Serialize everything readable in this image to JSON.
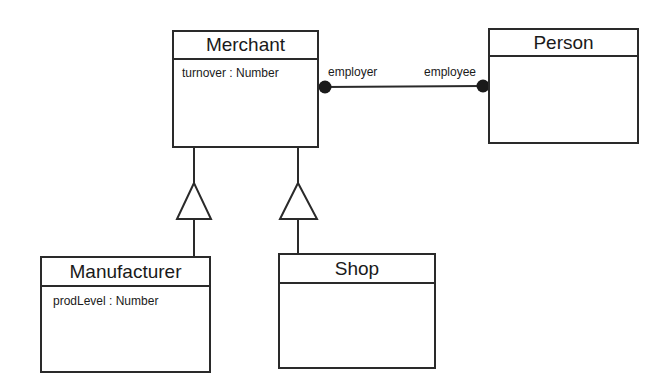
{
  "diagram": {
    "type": "UML class diagram",
    "classes": [
      {
        "id": "merchant",
        "name": "Merchant",
        "attributes": [
          "turnover : Number"
        ]
      },
      {
        "id": "person",
        "name": "Person",
        "attributes": []
      },
      {
        "id": "manufacturer",
        "name": "Manufacturer",
        "attributes": [
          "prodLevel : Number"
        ]
      },
      {
        "id": "shop",
        "name": "Shop",
        "attributes": []
      }
    ],
    "associations": [
      {
        "from": "merchant",
        "to": "person",
        "from_role": "employer",
        "to_role": "employee",
        "end_style": "filled-dot"
      }
    ],
    "generalizations": [
      {
        "child": "manufacturer",
        "parent": "merchant"
      },
      {
        "child": "shop",
        "parent": "merchant"
      }
    ],
    "colors": {
      "line": "#2a2a2a",
      "background": "#ffffff",
      "text": "#1a1a1a"
    }
  }
}
